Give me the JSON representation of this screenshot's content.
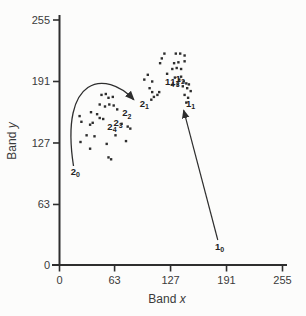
{
  "figure": {
    "background": "#fcfcfb",
    "ink": "#2e2e2e",
    "text_color": "#3a3a3a"
  },
  "chart_data": {
    "type": "scatter",
    "title": "",
    "xlabel": {
      "text": "Band",
      "var": "x"
    },
    "ylabel": {
      "text": "Band",
      "var": "y"
    },
    "xlim": [
      0,
      255
    ],
    "ylim": [
      0,
      255
    ],
    "xticks": [
      0,
      63,
      127,
      191,
      255
    ],
    "yticks": [
      0,
      63,
      127,
      191,
      255
    ],
    "grid": false,
    "legend": false,
    "points": [
      [
        48,
        177
      ],
      [
        53,
        178
      ],
      [
        56,
        174
      ],
      [
        61,
        175
      ],
      [
        46,
        167
      ],
      [
        52,
        165
      ],
      [
        57,
        167
      ],
      [
        62,
        166
      ],
      [
        36,
        159
      ],
      [
        43,
        157
      ],
      [
        46,
        153
      ],
      [
        50,
        152
      ],
      [
        23,
        155
      ],
      [
        25,
        149
      ],
      [
        35,
        146
      ],
      [
        38,
        148
      ],
      [
        66,
        162
      ],
      [
        71,
        147
      ],
      [
        78,
        144
      ],
      [
        81,
        142
      ],
      [
        31,
        135
      ],
      [
        24,
        128
      ],
      [
        35,
        121
      ],
      [
        40,
        134
      ],
      [
        54,
        126
      ],
      [
        76,
        129
      ],
      [
        64,
        135
      ],
      [
        56,
        112
      ],
      [
        59,
        110
      ],
      [
        105,
        172
      ],
      [
        108,
        175
      ],
      [
        112,
        177
      ],
      [
        101,
        198
      ],
      [
        97,
        193
      ],
      [
        106,
        191
      ],
      [
        103,
        184
      ],
      [
        106,
        180
      ],
      [
        114,
        180
      ],
      [
        120,
        220
      ],
      [
        117,
        215
      ],
      [
        115,
        210
      ],
      [
        133,
        220
      ],
      [
        138,
        220
      ],
      [
        143,
        218
      ],
      [
        131,
        210
      ],
      [
        136,
        211
      ],
      [
        143,
        212
      ],
      [
        129,
        204
      ],
      [
        134,
        205
      ],
      [
        139,
        204
      ],
      [
        123,
        199
      ],
      [
        139,
        196
      ],
      [
        132,
        195
      ],
      [
        137,
        193
      ],
      [
        142,
        191
      ],
      [
        145,
        189
      ],
      [
        148,
        188
      ],
      [
        135,
        188
      ],
      [
        141,
        186
      ],
      [
        146,
        184
      ],
      [
        150,
        181
      ],
      [
        143,
        177
      ],
      [
        147,
        174
      ],
      [
        145,
        169
      ]
    ],
    "trajectories": [
      {
        "name": "trajectory-1",
        "labels": [
          {
            "base": "1",
            "sub": "0",
            "x": 183,
            "y": 19
          },
          {
            "base": "1",
            "sub": "1",
            "x": 150,
            "y": 168
          },
          {
            "base": "1",
            "sub": "2",
            "x": 138,
            "y": 194
          },
          {
            "base": "1",
            "sub": "3",
            "x": 132,
            "y": 191
          },
          {
            "base": "1",
            "sub": "4",
            "x": 126,
            "y": 191
          }
        ],
        "arrow": {
          "type": "line",
          "from": [
            181,
            26
          ],
          "to": [
            142,
            161
          ]
        }
      },
      {
        "name": "trajectory-2",
        "labels": [
          {
            "base": "2",
            "sub": "0",
            "x": 18,
            "y": 97
          },
          {
            "base": "2",
            "sub": "1",
            "x": 97,
            "y": 168
          },
          {
            "base": "2",
            "sub": "2",
            "x": 77,
            "y": 158
          },
          {
            "base": "2",
            "sub": "3",
            "x": 67,
            "y": 148
          },
          {
            "base": "2",
            "sub": "4",
            "x": 60,
            "y": 144
          }
        ],
        "arrow": {
          "type": "cubic",
          "pts": [
            [
              16,
              103
            ],
            [
              0,
              198
            ],
            [
              53,
              203
            ],
            [
              85,
              172
            ]
          ]
        }
      }
    ]
  }
}
